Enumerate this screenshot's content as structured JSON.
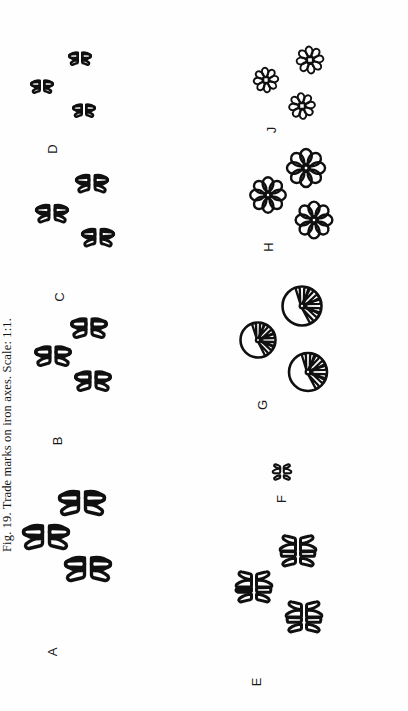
{
  "figure": {
    "caption_prefix": "Fig.",
    "caption_number": "19.",
    "caption_text": "Trade marks on iron axes.",
    "caption_scale": "Scale: 1:1.",
    "caption_full": "Fig. 19. Trade marks on iron axes. Scale: 1:1.",
    "ink_color": "#101010",
    "background_color": "#ffffff",
    "orientation": "rotated-90-ccw",
    "rows": 2,
    "columns": 4
  },
  "panels": [
    {
      "id": "A",
      "label": "A",
      "motif": "cross-in-circle, four broad quadrant wedges",
      "count": 3,
      "segments": 4,
      "segment_style": "broad-wedge",
      "size": "large"
    },
    {
      "id": "B",
      "label": "B",
      "motif": "cross-in-circle, four rounded quadrant wedges",
      "count": 3,
      "segments": 4,
      "segment_style": "rounded-wedge",
      "size": "medium"
    },
    {
      "id": "C",
      "label": "C",
      "motif": "cross-in-circle, four narrow triangular wedges",
      "count": 3,
      "segments": 4,
      "segment_style": "triangular-wedge",
      "size": "medium"
    },
    {
      "id": "D",
      "label": "D",
      "motif": "cross-in-circle, four small triangular wedges",
      "count": 3,
      "segments": 4,
      "segment_style": "triangular-wedge",
      "size": "small"
    },
    {
      "id": "E",
      "label": "E",
      "motif": "circle divided into six cells by one vertical and two horizontal bars",
      "count": 3,
      "segments": 6,
      "segment_style": "grid-cell",
      "size": "large"
    },
    {
      "id": "F",
      "label": "F",
      "motif": "cross-in-circle, four small wedges",
      "count": 1,
      "segments": 4,
      "segment_style": "wedge",
      "size": "very-small"
    },
    {
      "id": "G",
      "label": "G",
      "motif": "radiating sunburst wheel, eight pie wedges",
      "count": 3,
      "segments": 8,
      "segment_style": "pie-wedge",
      "size": "medium"
    },
    {
      "id": "H",
      "label": "H",
      "motif": "rosette flower with eight rounded petals",
      "count": 3,
      "segments": 8,
      "segment_style": "rounded-petal",
      "size": "medium"
    },
    {
      "id": "J",
      "label": "J",
      "motif": "small star rosette with eight narrow petals and square centre",
      "count": 3,
      "segments": 8,
      "segment_style": "narrow-petal",
      "size": "small"
    }
  ]
}
